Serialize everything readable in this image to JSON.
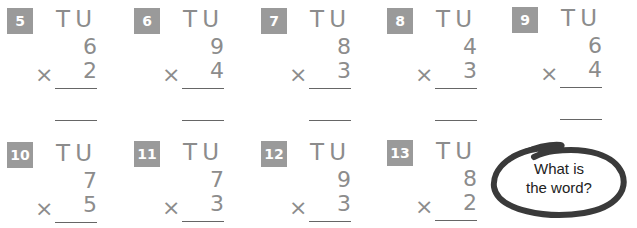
{
  "column_header": "TU",
  "problems_row1": [
    {
      "number": "5",
      "top": "6",
      "bottom": "2",
      "operator": "×"
    },
    {
      "number": "6",
      "top": "9",
      "bottom": "4",
      "operator": "×"
    },
    {
      "number": "7",
      "top": "8",
      "bottom": "3",
      "operator": "×"
    },
    {
      "number": "8",
      "top": "4",
      "bottom": "3",
      "operator": "×"
    },
    {
      "number": "9",
      "top": "6",
      "bottom": "4",
      "operator": "×"
    }
  ],
  "problems_row2": [
    {
      "number": "10",
      "top": "7",
      "bottom": "5",
      "operator": "×"
    },
    {
      "number": "11",
      "top": "7",
      "bottom": "3",
      "operator": "×"
    },
    {
      "number": "12",
      "top": "9",
      "bottom": "3",
      "operator": "×"
    },
    {
      "number": "13",
      "top": "8",
      "bottom": "2",
      "operator": "×"
    }
  ],
  "bubble": {
    "line1": "What is",
    "line2": "the word?"
  }
}
